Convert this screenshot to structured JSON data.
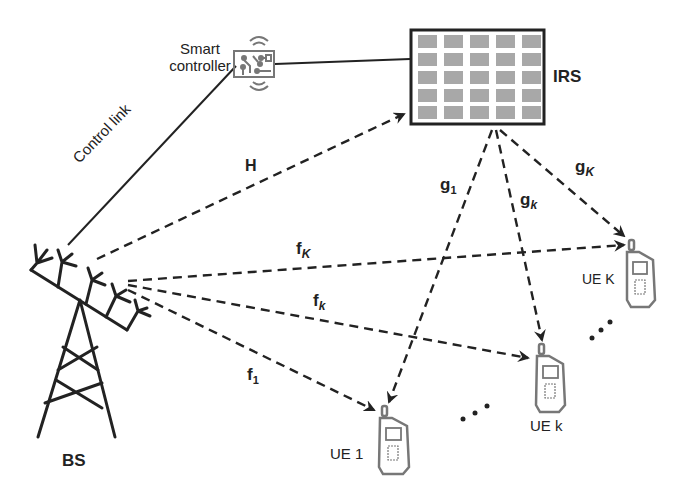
{
  "diagram": {
    "nodes": {
      "bs": {
        "label": "BS"
      },
      "irs": {
        "label": "IRS",
        "grid_rows": 5,
        "grid_cols": 5
      },
      "controller": {
        "label_line1": "Smart",
        "label_line2": "controller"
      },
      "ue1": {
        "label": "UE 1"
      },
      "uek": {
        "label": "UE k"
      },
      "ueK": {
        "label": "UE K"
      }
    },
    "links": {
      "control": {
        "label": "Control link",
        "style": "solid"
      },
      "H": {
        "label": "H",
        "from": "BS",
        "to": "IRS",
        "style": "dashed"
      },
      "f1": {
        "base": "f",
        "sub": "1",
        "from": "BS",
        "to": "UE 1"
      },
      "fk": {
        "base": "f",
        "sub": "k",
        "from": "BS",
        "to": "UE k"
      },
      "fK": {
        "base": "f",
        "sub": "K",
        "from": "BS",
        "to": "UE K"
      },
      "g1": {
        "base": "g",
        "sub": "1",
        "from": "IRS",
        "to": "UE 1"
      },
      "gk": {
        "base": "g",
        "sub": "k",
        "from": "IRS",
        "to": "UE k"
      },
      "gK": {
        "base": "g",
        "sub": "K",
        "from": "IRS",
        "to": "UE K"
      }
    },
    "ellipsis": [
      "...",
      "..."
    ],
    "colors": {
      "line": "#222222",
      "tile": "#a8a8a8",
      "device": "#777777"
    }
  }
}
